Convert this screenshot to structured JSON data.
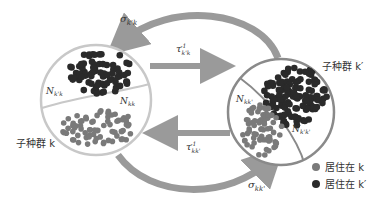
{
  "diagram": {
    "subpopulations": [
      {
        "id": "k",
        "label": "子种群 k",
        "regions": [
          {
            "label": "N",
            "sub": "k'k",
            "resident_of": "k'"
          },
          {
            "label": "N",
            "sub": "kk",
            "resident_of": "k"
          }
        ]
      },
      {
        "id": "k'",
        "label": "子种群 k′",
        "regions": [
          {
            "label": "N",
            "sub": "kk'",
            "resident_of": "k"
          },
          {
            "label": "N",
            "sub": "k'k'",
            "resident_of": "k'"
          }
        ]
      }
    ],
    "arrows": {
      "sigma_top": {
        "symbol": "σ",
        "sub": "k'k"
      },
      "sigma_bottom": {
        "symbol": "σ",
        "sub": "kk'"
      },
      "tau_top": {
        "symbol": "τ",
        "sub": "k'k",
        "sup": "-1"
      },
      "tau_bottom": {
        "symbol": "τ",
        "sub": "kk'",
        "sup": "-1"
      }
    },
    "legend": [
      {
        "label": "居住在 k",
        "color": "#7a7a7a"
      },
      {
        "label": "居住在 k′",
        "color": "#2a2a2a"
      }
    ],
    "colors": {
      "arrow": "#9a9a9a",
      "circle_left": "#c8c8c8",
      "circle_right": "#8a8a8a",
      "resident_k": "#7a7a7a",
      "resident_kprime": "#2a2a2a"
    }
  }
}
